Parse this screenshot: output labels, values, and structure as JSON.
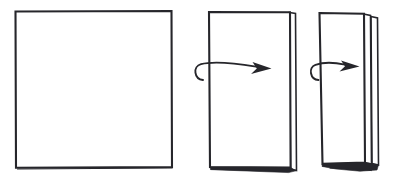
{
  "figure": {
    "background_color": "#ffffff",
    "ink_color": "#26262b",
    "paper_color": "#ffffff",
    "canvas": {
      "width": 397,
      "height": 183
    },
    "step_count": 3,
    "steps": [
      {
        "index": 1,
        "name": "unfolded-square-sheet",
        "label": "",
        "shape": "square",
        "layers": 1,
        "has_arrow": false,
        "arrow_direction": "",
        "bounds": {
          "x": 14,
          "y": 10,
          "width": 158,
          "height": 158
        }
      },
      {
        "index": 2,
        "name": "half-folded-sheet",
        "label": "",
        "shape": "tall-rectangle",
        "layers": 2,
        "has_arrow": true,
        "arrow_direction": "left-to-right-curved-fold-over",
        "bounds": {
          "x": 208,
          "y": 10,
          "width": 88,
          "height": 158
        }
      },
      {
        "index": 3,
        "name": "quarter-folded-sheet",
        "label": "",
        "shape": "narrow-rectangle",
        "layers": 3,
        "has_arrow": true,
        "arrow_direction": "left-to-right-curved-fold-over",
        "bounds": {
          "x": 318,
          "y": 10,
          "width": 62,
          "height": 158
        }
      }
    ],
    "arrows": [
      {
        "name": "fold-arrow-step-2",
        "style": "curved-hook-tail-solid-triangle-head",
        "start_x": 196,
        "start_y": 70,
        "end_x": 268,
        "end_y": 68
      },
      {
        "name": "fold-arrow-step-3",
        "style": "curved-hook-tail-solid-triangle-head",
        "start_x": 308,
        "start_y": 74,
        "end_x": 354,
        "end_y": 66
      }
    ]
  }
}
